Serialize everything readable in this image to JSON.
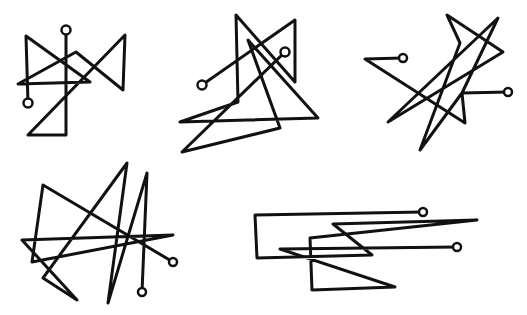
{
  "canvas": {
    "width": 527,
    "height": 315,
    "background": "#ffffff",
    "ink": "#111111"
  },
  "figures": [
    {
      "id": "sigil-1",
      "points": "66,30 66,135 28,135 125,35 123,90 76,52 18,84 90,82 26,36 28,103",
      "circles": [
        [
          66,
          30
        ],
        [
          28,
          103
        ]
      ]
    },
    {
      "id": "sigil-2",
      "points": "202,85 295,20 295,82 236,15 238,102 180,122 318,118 248,40 280,128 182,152 285,52",
      "circles": [
        [
          202,
          85
        ],
        [
          285,
          52
        ]
      ]
    },
    {
      "id": "sigil-3",
      "points": "403,58 365,59 465,123 462,93 420,150 460,43 447,15 503,52 388,122 498,18 462,93 508,92",
      "circles": [
        [
          403,
          58
        ],
        [
          508,
          92
        ]
      ]
    },
    {
      "id": "sigil-4",
      "points": "142,292 147,173 108,303 127,163 43,278 77,300 22,240 173,235 32,262 43,185 173,262",
      "circles": [
        [
          142,
          292
        ],
        [
          173,
          262
        ]
      ]
    },
    {
      "id": "sigil-5",
      "points": "423,212 255,215 257,258 372,255 333,224 477,220 310,238 312,290 395,287 280,249 457,247",
      "circles": [
        [
          423,
          212
        ],
        [
          457,
          247
        ]
      ]
    }
  ]
}
